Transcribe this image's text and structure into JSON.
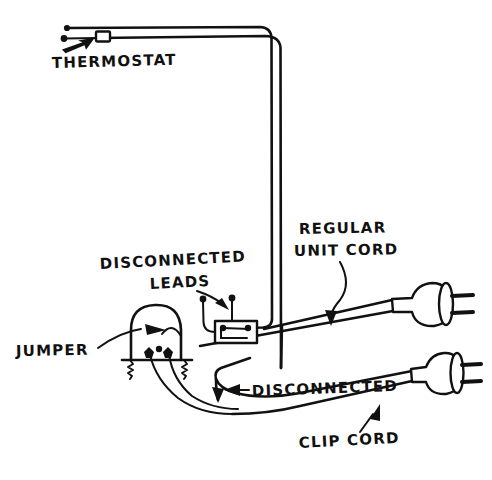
{
  "figure": {
    "kind": "hand-drawn-wiring-diagram",
    "background_color": "#ffffff",
    "ink_color": "#111111",
    "width": 492,
    "height": 480
  },
  "labels": {
    "thermostat": "THERMOSTAT",
    "regular_unit_cord_line1": "REGULAR",
    "regular_unit_cord_line2": "UNIT CORD",
    "disconnected_leads_line1": "DISCONNECTED",
    "disconnected_leads_line2": "LEADS",
    "jumper": "JUMPER",
    "disconnected": "DISCONNECTED",
    "clip_cord": "CLIP CORD"
  },
  "components": {
    "thermostat_body": "thermostat-block",
    "switch_box": "switch-box",
    "clip_assembly": "clip-assembly",
    "plug_upper": "plug-regular-unit-cord",
    "plug_lower": "plug-clip-cord",
    "spring_left": "clip-spring-left",
    "spring_right": "clip-spring-right"
  }
}
